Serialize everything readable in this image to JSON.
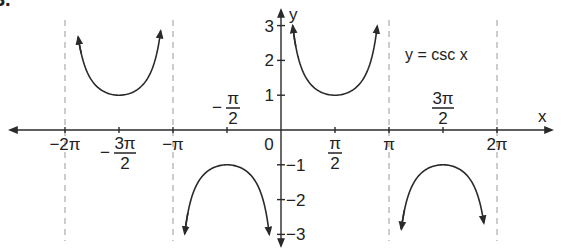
{
  "figure": {
    "problem_number_fragment": "3.",
    "equation_label": "y = csc x"
  },
  "chart_data": {
    "type": "line",
    "title": "y = csc x",
    "function": "csc",
    "xlabel": "x",
    "ylabel": "y",
    "xlim": [
      -6.6,
      7.9
    ],
    "ylim": [
      -3.4,
      3.5
    ],
    "grid": false,
    "legend": null,
    "x_ticks": [
      {
        "value": -6.2832,
        "label": "−2π",
        "position": "below"
      },
      {
        "value": -4.7124,
        "label_num": "3π",
        "label_den": "2",
        "sign": "−",
        "position": "below"
      },
      {
        "value": -3.1416,
        "label": "−π",
        "position": "below"
      },
      {
        "value": -1.5708,
        "label_num": "π",
        "label_den": "2",
        "sign": "−",
        "position": "above"
      },
      {
        "value": 0,
        "label": "0",
        "position": "below-left"
      },
      {
        "value": 1.5708,
        "label_num": "π",
        "label_den": "2",
        "sign": "",
        "position": "below"
      },
      {
        "value": 3.1416,
        "label": "π",
        "position": "below"
      },
      {
        "value": 4.7124,
        "label_num": "3π",
        "label_den": "2",
        "sign": "",
        "position": "above"
      },
      {
        "value": 6.2832,
        "label": "2π",
        "position": "below"
      }
    ],
    "y_ticks": [
      {
        "value": 3,
        "label": "3"
      },
      {
        "value": 2,
        "label": "2"
      },
      {
        "value": 1,
        "label": "1"
      },
      {
        "value": -1,
        "label": "−1"
      },
      {
        "value": -2,
        "label": "−2"
      },
      {
        "value": -3,
        "label": "−3"
      }
    ],
    "asymptotes": [
      -6.2832,
      -3.1416,
      3.1416,
      6.2832
    ],
    "series": [
      {
        "name": "branch (-2π, -π)",
        "x_start": -5.9,
        "x_end": -3.5,
        "vertex": [
          -4.7124,
          1
        ]
      },
      {
        "name": "branch (-π, 0)",
        "x_start": -2.8,
        "x_end": -0.34,
        "vertex": [
          -1.5708,
          -1
        ]
      },
      {
        "name": "branch (0, π)",
        "x_start": 0.34,
        "x_end": 2.8,
        "vertex": [
          1.5708,
          1
        ]
      },
      {
        "name": "branch (π, 2π)",
        "x_start": 3.5,
        "x_end": 5.9,
        "vertex": [
          4.7124,
          -1
        ]
      }
    ],
    "annotations": [
      "y = csc x"
    ]
  }
}
